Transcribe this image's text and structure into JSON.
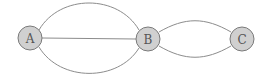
{
  "diagram": {
    "type": "multigraph",
    "nodes": [
      {
        "id": "A",
        "label": "A",
        "x": 30,
        "y": 38
      },
      {
        "id": "B",
        "label": "B",
        "x": 148,
        "y": 39
      },
      {
        "id": "C",
        "label": "C",
        "x": 242,
        "y": 39
      }
    ],
    "edges": [
      {
        "from": "A",
        "to": "B",
        "shape": "arc-up"
      },
      {
        "from": "A",
        "to": "B",
        "shape": "straight"
      },
      {
        "from": "A",
        "to": "B",
        "shape": "arc-down"
      },
      {
        "from": "B",
        "to": "C",
        "shape": "arc-up"
      },
      {
        "from": "B",
        "to": "C",
        "shape": "arc-down"
      }
    ],
    "colors": {
      "node_fill": "#d0d0d0",
      "node_stroke": "#7a7a7a",
      "edge": "#8c8c8c",
      "label": "#555555"
    }
  }
}
